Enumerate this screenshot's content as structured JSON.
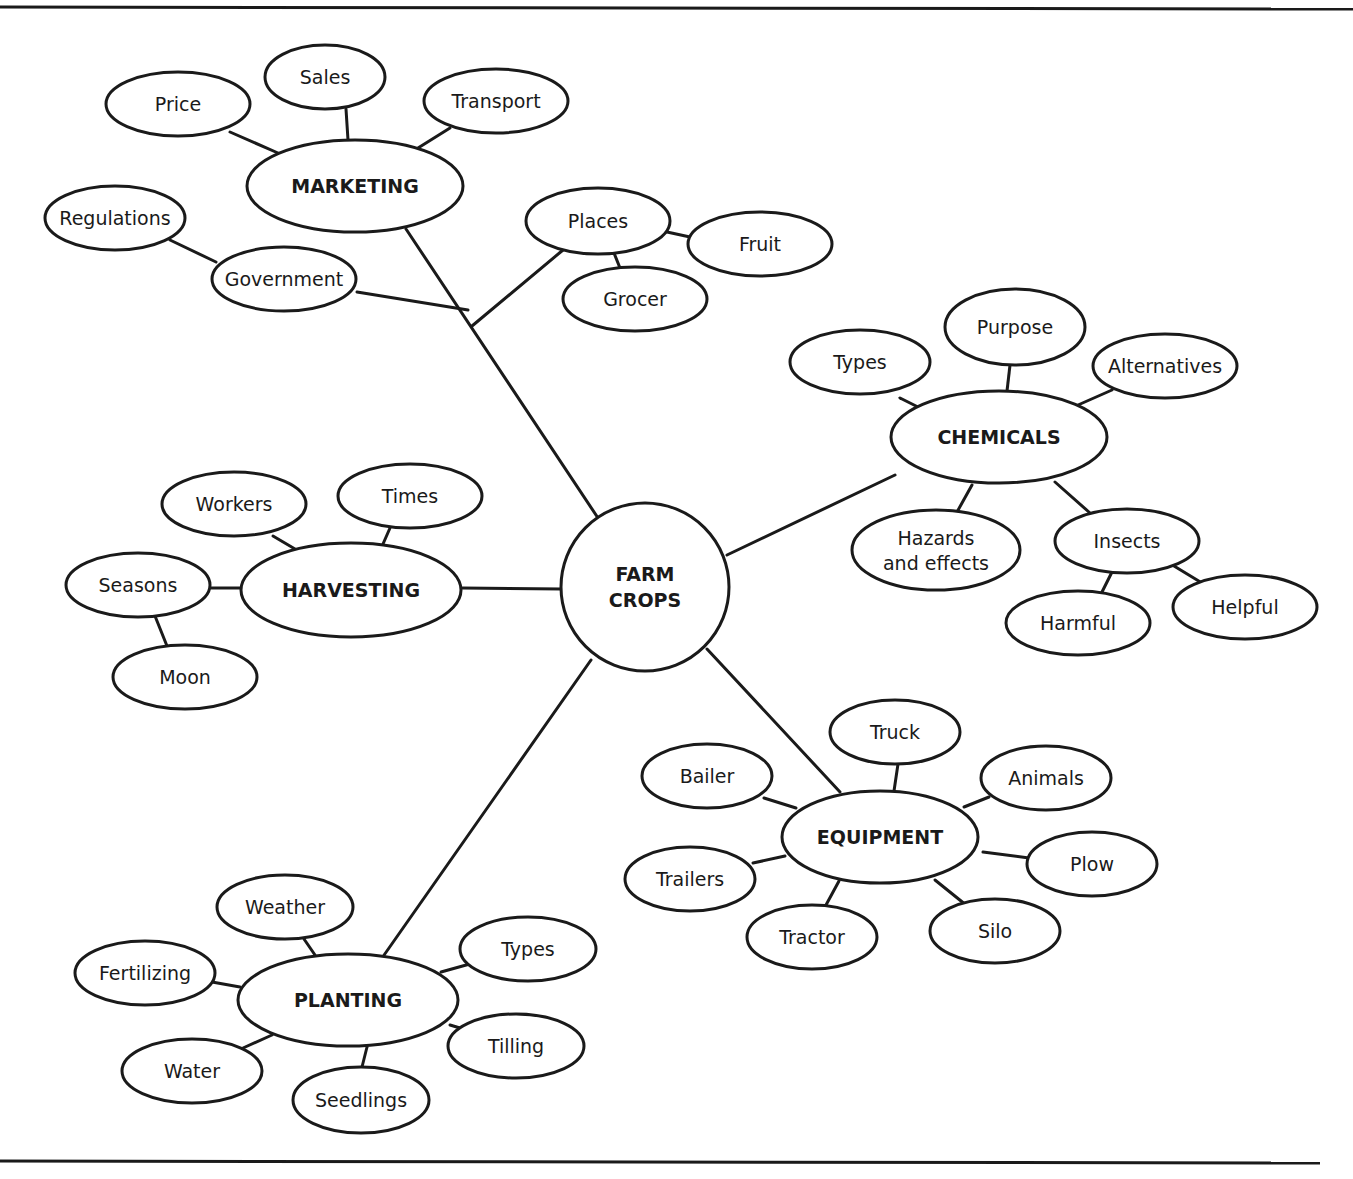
{
  "diagram": {
    "type": "concept-map",
    "center": {
      "id": "farm-crops",
      "lines": [
        "FARM",
        "CROPS"
      ],
      "x": 645,
      "y": 587,
      "r": 84
    },
    "branches": [
      {
        "id": "marketing",
        "label": "MARKETING",
        "x": 355,
        "y": 186,
        "rx": 108,
        "ry": 46,
        "children": [
          {
            "id": "price",
            "label": "Price",
            "x": 178,
            "y": 104,
            "rx": 72,
            "ry": 32
          },
          {
            "id": "sales",
            "label": "Sales",
            "x": 325,
            "y": 77,
            "rx": 60,
            "ry": 32
          },
          {
            "id": "transport",
            "label": "Transport",
            "x": 496,
            "y": 101,
            "rx": 72,
            "ry": 32
          },
          {
            "id": "regulations",
            "label": "Regulations",
            "x": 115,
            "y": 218,
            "rx": 70,
            "ry": 32
          },
          {
            "id": "government",
            "label": "Government",
            "x": 284,
            "y": 279,
            "rx": 72,
            "ry": 32
          },
          {
            "id": "places",
            "label": "Places",
            "x": 598,
            "y": 221,
            "rx": 72,
            "ry": 33
          },
          {
            "id": "fruit",
            "label": "Fruit",
            "x": 760,
            "y": 244,
            "rx": 72,
            "ry": 32
          },
          {
            "id": "grocer",
            "label": "Grocer",
            "x": 635,
            "y": 299,
            "rx": 72,
            "ry": 32
          }
        ]
      },
      {
        "id": "chemicals",
        "label": "CHEMICALS",
        "x": 999,
        "y": 437,
        "rx": 108,
        "ry": 46,
        "children": [
          {
            "id": "chem-types",
            "label": "Types",
            "x": 860,
            "y": 362,
            "rx": 70,
            "ry": 32
          },
          {
            "id": "purpose",
            "label": "Purpose",
            "x": 1015,
            "y": 327,
            "rx": 70,
            "ry": 38
          },
          {
            "id": "alternatives",
            "label": "Alternatives",
            "x": 1165,
            "y": 366,
            "rx": 72,
            "ry": 32
          },
          {
            "id": "hazards",
            "label": "Hazards",
            "label2": "and effects",
            "x": 936,
            "y": 550,
            "rx": 84,
            "ry": 40
          },
          {
            "id": "insects",
            "label": "Insects",
            "x": 1127,
            "y": 541,
            "rx": 72,
            "ry": 32
          },
          {
            "id": "harmful",
            "label": "Harmful",
            "x": 1078,
            "y": 623,
            "rx": 72,
            "ry": 32
          },
          {
            "id": "helpful",
            "label": "Helpful",
            "x": 1245,
            "y": 607,
            "rx": 72,
            "ry": 32
          }
        ]
      },
      {
        "id": "harvesting",
        "label": "HARVESTING",
        "x": 351,
        "y": 590,
        "rx": 110,
        "ry": 47,
        "children": [
          {
            "id": "workers",
            "label": "Workers",
            "x": 234,
            "y": 504,
            "rx": 72,
            "ry": 32
          },
          {
            "id": "times",
            "label": "Times",
            "x": 410,
            "y": 496,
            "rx": 72,
            "ry": 32
          },
          {
            "id": "seasons",
            "label": "Seasons",
            "x": 138,
            "y": 585,
            "rx": 72,
            "ry": 32
          },
          {
            "id": "moon",
            "label": "Moon",
            "x": 185,
            "y": 677,
            "rx": 72,
            "ry": 32
          }
        ]
      },
      {
        "id": "equipment",
        "label": "EQUIPMENT",
        "x": 880,
        "y": 837,
        "rx": 98,
        "ry": 46,
        "children": [
          {
            "id": "truck",
            "label": "Truck",
            "x": 895,
            "y": 732,
            "rx": 65,
            "ry": 32
          },
          {
            "id": "bailer",
            "label": "Bailer",
            "x": 707,
            "y": 776,
            "rx": 65,
            "ry": 32
          },
          {
            "id": "animals",
            "label": "Animals",
            "x": 1046,
            "y": 778,
            "rx": 65,
            "ry": 32
          },
          {
            "id": "plow",
            "label": "Plow",
            "x": 1092,
            "y": 864,
            "rx": 65,
            "ry": 32
          },
          {
            "id": "trailers",
            "label": "Trailers",
            "x": 690,
            "y": 879,
            "rx": 65,
            "ry": 32
          },
          {
            "id": "tractor",
            "label": "Tractor",
            "x": 812,
            "y": 937,
            "rx": 65,
            "ry": 32
          },
          {
            "id": "silo",
            "label": "Silo",
            "x": 995,
            "y": 931,
            "rx": 65,
            "ry": 32
          }
        ]
      },
      {
        "id": "planting",
        "label": "PLANTING",
        "x": 348,
        "y": 1000,
        "rx": 110,
        "ry": 46,
        "children": [
          {
            "id": "weather",
            "label": "Weather",
            "x": 285,
            "y": 907,
            "rx": 68,
            "ry": 32
          },
          {
            "id": "fertilizing",
            "label": "Fertilizing",
            "x": 145,
            "y": 973,
            "rx": 70,
            "ry": 32
          },
          {
            "id": "plant-types",
            "label": "Types",
            "x": 528,
            "y": 949,
            "rx": 68,
            "ry": 32
          },
          {
            "id": "tilling",
            "label": "Tilling",
            "x": 516,
            "y": 1046,
            "rx": 68,
            "ry": 32
          },
          {
            "id": "water",
            "label": "Water",
            "x": 192,
            "y": 1071,
            "rx": 70,
            "ry": 32
          },
          {
            "id": "seedlings",
            "label": "Seedlings",
            "x": 361,
            "y": 1100,
            "rx": 68,
            "ry": 33
          }
        ]
      }
    ],
    "edges": [
      [
        406,
        229,
        600,
        521
      ],
      [
        468,
        310,
        357,
        292
      ],
      [
        472,
        326,
        563,
        250
      ],
      [
        230,
        132,
        278,
        153
      ],
      [
        346,
        109,
        348,
        140
      ],
      [
        418,
        148,
        450,
        128
      ],
      [
        170,
        240,
        216,
        262
      ],
      [
        667,
        232,
        690,
        237
      ],
      [
        614,
        253,
        620,
        268
      ],
      [
        727,
        555,
        895,
        475
      ],
      [
        900,
        398,
        920,
        408
      ],
      [
        1010,
        365,
        1007,
        391
      ],
      [
        1078,
        405,
        1112,
        390
      ],
      [
        972,
        485,
        957,
        512
      ],
      [
        1055,
        482,
        1090,
        513
      ],
      [
        1112,
        572,
        1101,
        594
      ],
      [
        1174,
        566,
        1202,
        583
      ],
      [
        462,
        588,
        562,
        589
      ],
      [
        273,
        536,
        295,
        549
      ],
      [
        390,
        528,
        383,
        544
      ],
      [
        211,
        588,
        242,
        588
      ],
      [
        155,
        616,
        167,
        646
      ],
      [
        707,
        649,
        840,
        792
      ],
      [
        898,
        764,
        894,
        791
      ],
      [
        764,
        798,
        796,
        808
      ],
      [
        964,
        807,
        989,
        797
      ],
      [
        983,
        852,
        1029,
        858
      ],
      [
        753,
        863,
        785,
        856
      ],
      [
        826,
        905,
        839,
        881
      ],
      [
        935,
        880,
        966,
        905
      ],
      [
        591,
        660,
        382,
        958
      ],
      [
        304,
        939,
        315,
        955
      ],
      [
        212,
        982,
        240,
        987
      ],
      [
        441,
        972,
        477,
        962
      ],
      [
        450,
        1025,
        480,
        1034
      ],
      [
        243,
        1048,
        272,
        1035
      ],
      [
        362,
        1067,
        367,
        1047
      ]
    ],
    "page_rules": {
      "top": [
        0,
        7,
        1353,
        9
      ],
      "bottom": [
        0,
        1161,
        1320,
        1163
      ]
    }
  }
}
